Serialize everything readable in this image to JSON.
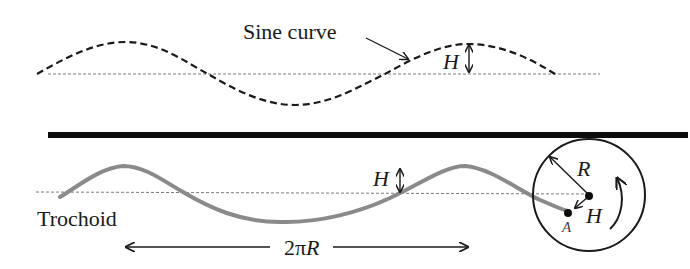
{
  "labels": {
    "sine_curve": "Sine curve",
    "trochoid": "Trochoid",
    "height_top": "H",
    "height_bottom": "H",
    "radius": "R",
    "circle_offset": "H",
    "point": "A",
    "wavelength_prefix": "2π",
    "wavelength_var": "R"
  },
  "colors": {
    "ink": "#1a1a1a",
    "trochoid": "#8a8a8a",
    "baseline": "#7a7a7a",
    "background": "#ffffff"
  }
}
